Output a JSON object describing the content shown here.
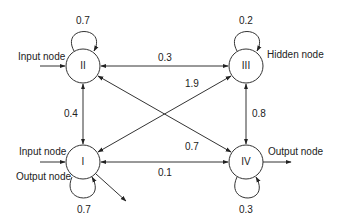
{
  "diagram": {
    "type": "recurrent neural network graph",
    "nodes": [
      {
        "id": "I",
        "label": "I",
        "roles": [
          "Input node",
          "Output node"
        ],
        "self_weight": "0.7"
      },
      {
        "id": "II",
        "label": "II",
        "roles": [
          "Input node"
        ],
        "self_weight": "0.7"
      },
      {
        "id": "III",
        "label": "III",
        "roles": [
          "Hidden node"
        ],
        "self_weight": "0.2"
      },
      {
        "id": "IV",
        "label": "IV",
        "roles": [
          "Output node"
        ],
        "self_weight": "0.3"
      }
    ],
    "edges": [
      {
        "from": "II",
        "to": "III",
        "weight": "0.3",
        "bidirectional": true
      },
      {
        "from": "I",
        "to": "III",
        "weight": "1.9",
        "bidirectional": true
      },
      {
        "from": "II",
        "to": "IV",
        "weight": "0.7",
        "bidirectional": true
      },
      {
        "from": "II",
        "to": "I",
        "weight": "0.4",
        "bidirectional": true
      },
      {
        "from": "III",
        "to": "IV",
        "weight": "0.8",
        "bidirectional": true
      },
      {
        "from": "I",
        "to": "IV",
        "weight": "0.1",
        "bidirectional": true
      }
    ],
    "annotations": {
      "input_II": "Input node",
      "input_I": "Input node",
      "output_I": "Output node",
      "hidden_III": "Hidden node",
      "output_IV": "Output node"
    },
    "weights": {
      "self_II": "0.7",
      "self_III": "0.2",
      "self_I": "0.7",
      "self_IV": "0.3",
      "II_III": "0.3",
      "I_III": "1.9",
      "II_IV": "0.7",
      "II_I": "0.4",
      "III_IV": "0.8",
      "I_IV": "0.1"
    }
  }
}
